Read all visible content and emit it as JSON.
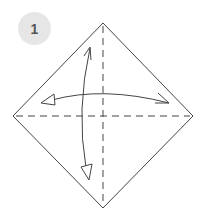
{
  "step": {
    "number": "1"
  },
  "colors": {
    "badge_bg": "#e6e6e6",
    "badge_text": "#555555",
    "line": "#444444"
  },
  "diagram": {
    "shape": "square-paper-diamond",
    "vertices": {
      "top": [
        103,
        23
      ],
      "right": [
        193,
        116
      ],
      "bottom": [
        103,
        208
      ],
      "left": [
        13,
        116
      ]
    },
    "folds": [
      {
        "type": "valley-dashed",
        "orientation": "horizontal",
        "from": [
          13,
          116
        ],
        "to": [
          193,
          116
        ]
      },
      {
        "type": "valley-dashed",
        "orientation": "vertical",
        "from": [
          103,
          23
        ],
        "to": [
          103,
          208
        ]
      }
    ],
    "arrows": [
      {
        "name": "fold-unfold-horizontal",
        "from": "left",
        "to": "right"
      },
      {
        "name": "fold-unfold-vertical",
        "from": "top",
        "to": "bottom"
      }
    ]
  }
}
